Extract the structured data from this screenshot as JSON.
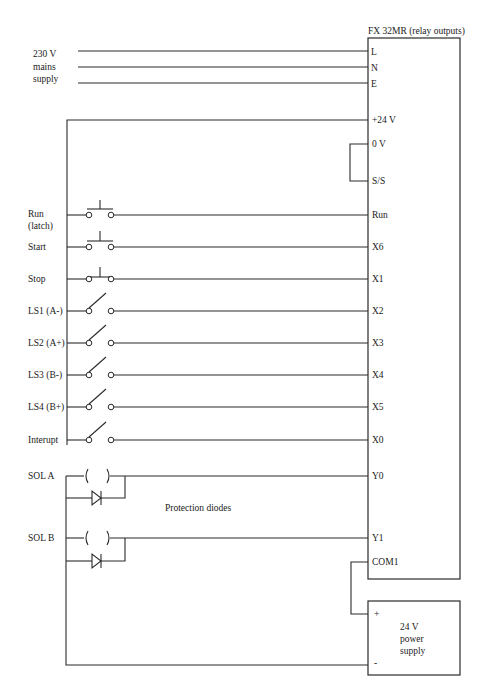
{
  "plc": {
    "title": "FX 32MR (relay outputs)",
    "power_terminals": [
      "L",
      "N",
      "E"
    ],
    "supply_terminals": [
      "+24 V",
      "0 V",
      "S/S"
    ],
    "input_terminals": [
      "Run",
      "X6",
      "X1",
      "X2",
      "X3",
      "X4",
      "X5",
      "X0"
    ],
    "output_terminals": [
      "Y0",
      "Y1",
      "COM1"
    ]
  },
  "mains": {
    "line1": "230 V",
    "line2": "mains",
    "line3": "supply"
  },
  "inputs": [
    {
      "label": "Run",
      "sublabel": "(latch)",
      "type": "push-button-no",
      "terminal": "Run"
    },
    {
      "label": "Start",
      "sublabel": "",
      "type": "push-button-no",
      "terminal": "X6"
    },
    {
      "label": "Stop",
      "sublabel": "",
      "type": "push-button-nc",
      "terminal": "X1"
    },
    {
      "label": "LS1 (A-)",
      "sublabel": "",
      "type": "limit-switch",
      "terminal": "X2"
    },
    {
      "label": "LS2 (A+)",
      "sublabel": "",
      "type": "limit-switch",
      "terminal": "X3"
    },
    {
      "label": "LS3 (B-)",
      "sublabel": "",
      "type": "limit-switch",
      "terminal": "X4"
    },
    {
      "label": "LS4 (B+)",
      "sublabel": "",
      "type": "limit-switch",
      "terminal": "X5"
    },
    {
      "label": "Interupt",
      "sublabel": "",
      "type": "limit-switch",
      "terminal": "X0"
    }
  ],
  "outputs": [
    {
      "label": "SOL A",
      "terminal": "Y0"
    },
    {
      "label": "SOL B",
      "terminal": "Y1"
    }
  ],
  "annotations": {
    "protection_diodes": "Protection diodes"
  },
  "power_supply": {
    "line1": "24 V",
    "line2": "power",
    "line3": "supply",
    "plus": "+",
    "minus": "-"
  }
}
